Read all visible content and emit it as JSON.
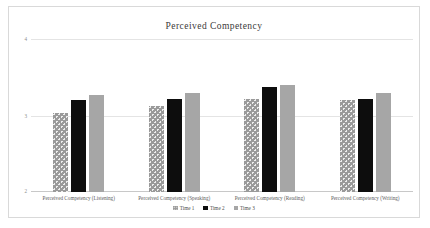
{
  "chart_data": {
    "type": "bar",
    "title": "Perceived Competency",
    "xlabel": "",
    "ylabel": "",
    "ylim": [
      2,
      4
    ],
    "yticks": [
      "2",
      "3",
      "4"
    ],
    "grid": true,
    "legend_position": "bottom",
    "categories": [
      "Perceived Competency (Listening)",
      "Perceived Competency (Speaking)",
      "Perceived Competency  (Reading)",
      "Perceived Competency (Writing)"
    ],
    "series": [
      {
        "name": "Time 1",
        "values": [
          3.03,
          3.12,
          3.21,
          3.2
        ]
      },
      {
        "name": "Time 2",
        "values": [
          3.2,
          3.21,
          3.37,
          3.21
        ]
      },
      {
        "name": "Time 3",
        "values": [
          3.27,
          3.3,
          3.4,
          3.3
        ]
      }
    ],
    "colors": {
      "series1": "#9a9a9a",
      "series2": "#0d0d0d",
      "series3": "#a6a6a6",
      "gridline": "#e4e4e4",
      "frame": "#d9d9d9",
      "title_text": "#3a3a3a",
      "tick_text": "#8d8d8d"
    }
  }
}
